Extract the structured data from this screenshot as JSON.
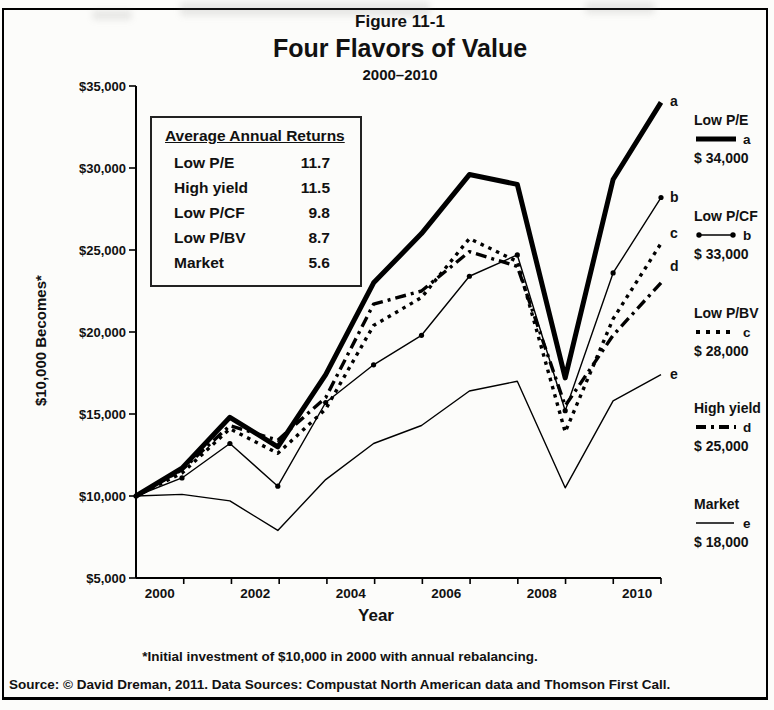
{
  "figure": {
    "label": "Figure 11-1",
    "title": "Four Flavors of Value",
    "subtitle": "2000–2010",
    "footnote": "*Initial investment of $10,000 in 2000 with annual rebalancing.",
    "source": "Source: © David Dreman, 2011. Data Sources: Compustat North American data and Thomson First Call."
  },
  "stats_box": {
    "title": "Average Annual Returns",
    "rows": [
      {
        "label": "Low P/E",
        "value": "11.7"
      },
      {
        "label": "High yield",
        "value": "11.5"
      },
      {
        "label": "Low P/CF",
        "value": "9.8"
      },
      {
        "label": "Low P/BV",
        "value": "8.7"
      },
      {
        "label": "Market",
        "value": "5.6"
      }
    ]
  },
  "axes": {
    "y_label": "$10,000 Becomes*",
    "x_label": "Year",
    "y_ticks": [
      "$35,000",
      "$30,000",
      "$25,000",
      "$20,000",
      "$15,000",
      "$10,000",
      "$5,000"
    ],
    "x_ticks": [
      "2000",
      "2002",
      "2004",
      "2006",
      "2008",
      "2010"
    ]
  },
  "legend": [
    {
      "name": "Low P/E",
      "letter": "a",
      "amount": "$ 34,000"
    },
    {
      "name": "Low P/CF",
      "letter": "b",
      "amount": "$ 33,000"
    },
    {
      "name": "Low P/BV",
      "letter": "c",
      "amount": "$ 28,000"
    },
    {
      "name": "High yield",
      "letter": "d",
      "amount": "$ 25,000"
    },
    {
      "name": "Market",
      "letter": "e",
      "amount": "$ 18,000"
    }
  ],
  "chart_data": {
    "type": "line",
    "title": "Four Flavors of Value",
    "subtitle": "2000–2010",
    "xlabel": "Year",
    "ylabel": "$10,000 Becomes*",
    "ylim": [
      5000,
      35000
    ],
    "ytick_step": 5000,
    "grid": false,
    "legend_position": "right",
    "x": [
      "2000 start",
      "2000",
      "2001",
      "2002",
      "2003",
      "2004",
      "2005",
      "2006",
      "2007",
      "2008",
      "2009",
      "2010"
    ],
    "series": [
      {
        "name": "Low P/E",
        "letter": "a",
        "style": "thick-solid",
        "final_label": "$ 34,000",
        "values": [
          10000,
          11700,
          14800,
          13000,
          17400,
          23000,
          26000,
          29600,
          29000,
          17200,
          29300,
          34000
        ]
      },
      {
        "name": "Low P/CF",
        "letter": "b",
        "style": "dot-marker",
        "final_label": "$ 33,000",
        "values": [
          10000,
          11100,
          13200,
          10600,
          15700,
          18000,
          19800,
          23400,
          24700,
          15200,
          23600,
          28200
        ]
      },
      {
        "name": "Low P/BV",
        "letter": "c",
        "style": "square-dot",
        "final_label": "$ 28,000",
        "label_dy": -9,
        "values": [
          10000,
          11400,
          14100,
          12600,
          15300,
          20400,
          22100,
          25700,
          24300,
          13900,
          20800,
          25400
        ]
      },
      {
        "name": "High yield",
        "letter": "d",
        "style": "dash-dot",
        "final_label": "$ 25,000",
        "label_dy": -16,
        "values": [
          10000,
          11600,
          14300,
          13400,
          16000,
          21700,
          22500,
          24900,
          24000,
          15500,
          19800,
          23000
        ]
      },
      {
        "name": "Market",
        "letter": "e",
        "style": "thin-solid",
        "final_label": "$ 18,000",
        "values": [
          10000,
          10100,
          9700,
          7900,
          11000,
          13200,
          14300,
          16400,
          17000,
          10500,
          15800,
          17400
        ]
      }
    ]
  }
}
